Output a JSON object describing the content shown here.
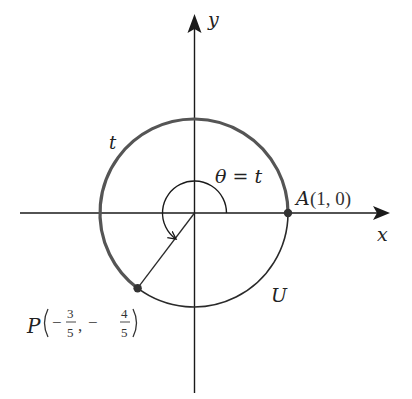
{
  "figure": {
    "type": "unit-circle-diagram",
    "axes": {
      "x_label": "x",
      "y_label": "y"
    },
    "circle_label": "U",
    "arc_label": "t",
    "angle_label": "θ = t",
    "point_A": {
      "name": "A",
      "coords": "(1, 0)",
      "x": 1,
      "y": 0
    },
    "point_P": {
      "name": "P",
      "x_num": "3",
      "x_den": "5",
      "y_num": "4",
      "y_den": "5",
      "x_sign": "−",
      "y_sign": "−",
      "x": -0.6,
      "y": -0.8
    },
    "colors": {
      "axis": "#1a1a1a",
      "thick_arc": "#555555",
      "thin_arc": "#2a2a2a",
      "point": "#333333"
    }
  }
}
